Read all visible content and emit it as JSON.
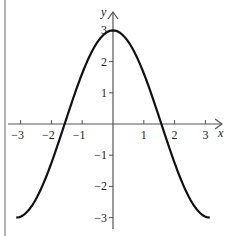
{
  "chart_data": {
    "type": "line",
    "title": "",
    "function": "y = 3cos(x)",
    "xlabel": "x",
    "ylabel": "y",
    "xlim": [
      -3.14159,
      3.14159
    ],
    "ylim": [
      -3,
      3
    ],
    "x_ticks": [
      -3,
      -2,
      -1,
      1,
      2,
      3
    ],
    "x_tick_labels": [
      "−3",
      "−2",
      "−1",
      "1",
      "2",
      "3"
    ],
    "y_ticks": [
      3,
      2,
      1,
      -1,
      -2,
      -3
    ],
    "y_tick_labels": [
      "3",
      "2",
      "1",
      "−1",
      "−2",
      "−3"
    ],
    "grid": false,
    "legend": null,
    "series": [
      {
        "name": "y = 3cos(x)",
        "color": "#111111",
        "x": [
          -3.1416,
          -2.5,
          -2,
          -1.5708,
          -1,
          -0.5,
          0,
          0.5,
          1,
          1.5708,
          2,
          2.5,
          3.1416
        ],
        "y": [
          -3,
          -2.4,
          -1.25,
          0,
          1.62,
          2.63,
          3,
          2.63,
          1.62,
          0,
          -1.25,
          -2.4,
          -3
        ]
      }
    ]
  },
  "layout": {
    "origin_px": [
      113,
      124
    ],
    "x_scale_px": 30.8,
    "y_scale_px": 31.2,
    "axis_color": "#555555",
    "curve_color": "#111111",
    "border_color": "#888888"
  }
}
